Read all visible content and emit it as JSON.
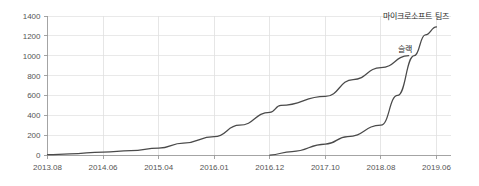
{
  "chart_data": {
    "type": "line",
    "title": "",
    "subtitle": "",
    "xlabel": "",
    "ylabel": "",
    "grid": true,
    "legend_position": "inline-annotation",
    "ylim": [
      0,
      1400
    ],
    "ytick_labels": [
      "0",
      "200",
      "400",
      "600",
      "800",
      "1000",
      "1200",
      "1400"
    ],
    "ytick_values": [
      0,
      200,
      400,
      600,
      800,
      1000,
      1200,
      1400
    ],
    "xtick_labels": [
      "2013.08",
      "2014.06",
      "2015.04",
      "2016.01",
      "2016.12",
      "2017.10",
      "2018.08",
      "2019.06"
    ],
    "series": [
      {
        "name": "슬랙",
        "annotation": "슬랙",
        "color": "#4a4a4a",
        "x": [
          "2013.08",
          "2013.12",
          "2014.06",
          "2014.11",
          "2015.04",
          "2015.08",
          "2016.01",
          "2016.06",
          "2016.12",
          "2017.02",
          "2017.10",
          "2018.03",
          "2018.08",
          "2019.01"
        ],
        "values": [
          3,
          12,
          30,
          45,
          70,
          120,
          185,
          300,
          430,
          500,
          590,
          760,
          880,
          1000
        ]
      },
      {
        "name": "마이크로소프트 팀즈",
        "annotation": "마이크로소프트 팀즈",
        "color": "#4a4a4a",
        "x": [
          "2016.12",
          "2017.04",
          "2017.10",
          "2018.02",
          "2018.08",
          "2018.11",
          "2019.02",
          "2019.04",
          "2019.06"
        ],
        "values": [
          0,
          35,
          110,
          185,
          300,
          600,
          1000,
          1210,
          1290
        ]
      }
    ]
  },
  "annotations": {
    "teams_label": "마이크로소프트 팀즈",
    "slack_label": "슬랙"
  },
  "colors": {
    "line": "#4a4a4a",
    "grid": "#e3e3e3",
    "axis": "#9a9a9a",
    "tick_text": "#555555",
    "annotation_text": "#2b2b2b",
    "background": "#ffffff"
  }
}
